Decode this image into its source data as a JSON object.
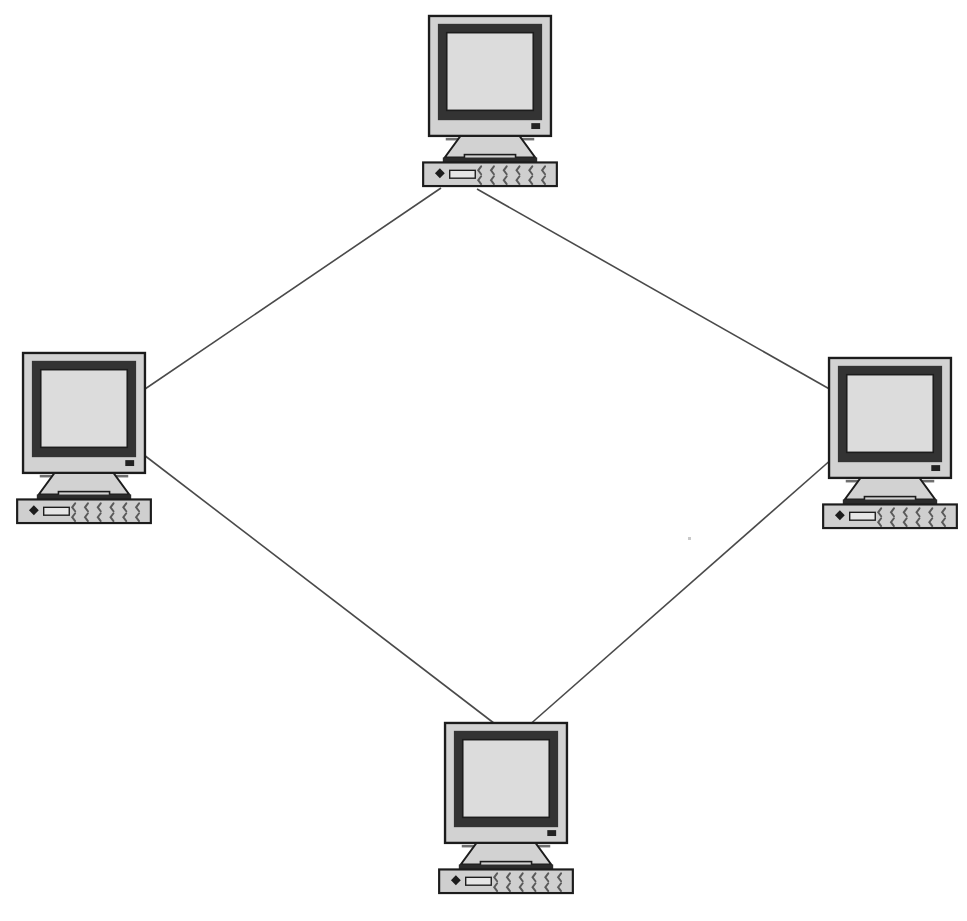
{
  "diagram": {
    "background_color": "#ffffff",
    "width": 967,
    "height": 921,
    "nodes": [
      {
        "id": "top",
        "label": "Top computer workstation",
        "icon": "crt-computer-icon",
        "x": 412,
        "y": 14
      },
      {
        "id": "left",
        "label": "Left computer workstation",
        "icon": "crt-computer-icon",
        "x": 6,
        "y": 351
      },
      {
        "id": "right",
        "label": "Right computer workstation",
        "icon": "crt-computer-icon",
        "x": 812,
        "y": 356
      },
      {
        "id": "bottom",
        "label": "Bottom computer workstation",
        "icon": "crt-computer-icon",
        "x": 428,
        "y": 721
      }
    ],
    "links": [
      {
        "id": "link-top-left",
        "from": "top",
        "to": "left",
        "x1": 441,
        "y1": 188,
        "x2": 145,
        "y2": 389
      },
      {
        "id": "link-top-right",
        "from": "top",
        "to": "right",
        "x1": 477,
        "y1": 189,
        "x2": 833,
        "y2": 391
      },
      {
        "id": "link-left-bottom",
        "from": "left",
        "to": "bottom",
        "x1": 144,
        "y1": 455,
        "x2": 499,
        "y2": 727
      },
      {
        "id": "link-right-bottom",
        "from": "right",
        "to": "bottom",
        "x1": 833,
        "y1": 458,
        "x2": 527,
        "y2": 727
      }
    ],
    "link_color": "#4a4a4a",
    "link_width": 1.6,
    "icon_colors": {
      "case": "#d2d2d2",
      "case_outline": "#1c1c1c",
      "bezel": "#333333",
      "screen": "#dcdcdc",
      "screen_outline": "#1c1c1c",
      "led": "#222222",
      "vent": "#6f6f6f",
      "keyboard": "#cfcfcf",
      "key": "#5a5a5a",
      "keyboard_strip": "#2b2b2b"
    },
    "caption": "",
    "speck": {
      "x": 688,
      "y": 537
    }
  }
}
